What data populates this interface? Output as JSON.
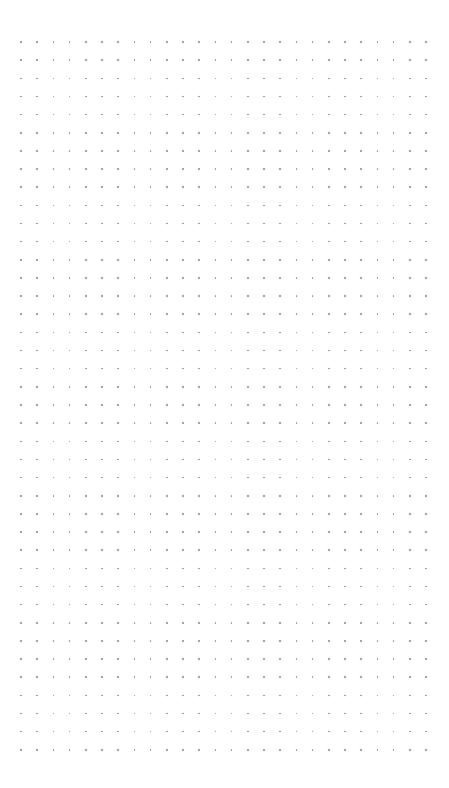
{
  "canvas": {
    "width": 449,
    "height": 788,
    "background": "#ffffff"
  },
  "dot_grid": {
    "columns": 26,
    "rows": 40,
    "origin_x": 21,
    "origin_y": 42,
    "spacing_x": 16.2,
    "spacing_y": 18.15,
    "dot_color": "#9a9a9a"
  }
}
